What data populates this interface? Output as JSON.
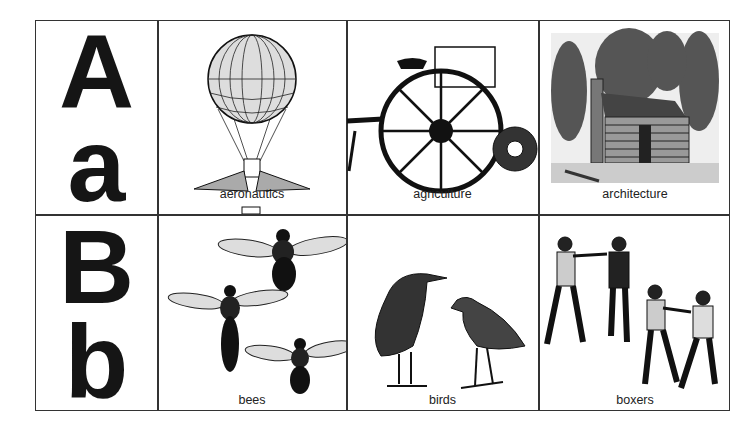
{
  "rows": [
    {
      "upper": "A",
      "lower": "a",
      "cells": [
        {
          "label": "aeronautics",
          "icon": "hot-air-balloon-illustration"
        },
        {
          "label": "agriculture",
          "icon": "farm-machine-illustration"
        },
        {
          "label": "architecture",
          "icon": "log-cabin-illustration"
        }
      ]
    },
    {
      "upper": "B",
      "lower": "b",
      "cells": [
        {
          "label": "bees",
          "icon": "bees-illustration"
        },
        {
          "label": "birds",
          "icon": "birds-illustration"
        },
        {
          "label": "boxers",
          "icon": "boxers-illustration"
        }
      ]
    }
  ],
  "colors": {
    "ink": "#151515",
    "grid": "#333333",
    "background": "#ffffff"
  }
}
